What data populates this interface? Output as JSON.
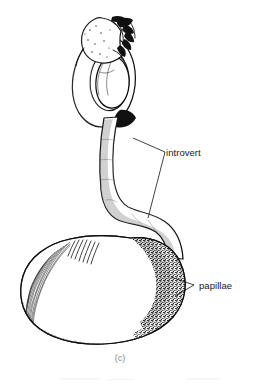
{
  "figure": {
    "kind": "scientific-illustration",
    "caption": "(c)",
    "background_color": "#ffffff",
    "ink_color": "#0d0d0d",
    "label_color": "#1a1a1a",
    "caption_color": "#8c8c8c",
    "width": 253,
    "height": 384
  },
  "labels": [
    {
      "id": "introvert",
      "text": "introvert",
      "text_x": 166,
      "text_y": 156,
      "leader_points": "133,138 165,152 148,218",
      "leader_style": "two-pronged-vee"
    },
    {
      "id": "papillae",
      "text": "papillae",
      "text_x": 199,
      "text_y": 289,
      "leader_points": "171,277 194,285 175,296",
      "leader_style": "two-pronged-vee"
    }
  ],
  "caption": {
    "text": "(c)",
    "x": 120,
    "y": 361
  },
  "anatomy": {
    "parts": [
      {
        "name": "anterior-tentacle-crown",
        "description": "bulbous stippled head bearing dark hooks and tentacles at the free end of the introvert"
      },
      {
        "name": "introvert-coil",
        "description": "slender introvert looped into a single coil below the tentacle crown"
      },
      {
        "name": "introvert-shaft",
        "description": "long sinuous stippled introvert tube descending in an S-curve to the trunk"
      },
      {
        "name": "trunk",
        "description": "large ovoid stippled body trunk, radiating striations at the left anterior margin"
      },
      {
        "name": "papillae-field",
        "description": "dense dark papillae clustered on the right posterior shoulder of the trunk"
      }
    ]
  }
}
